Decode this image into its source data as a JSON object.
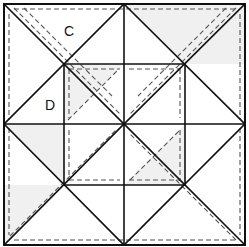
{
  "diagram": {
    "labels": [
      {
        "text": "C",
        "x": 64,
        "y": 36
      },
      {
        "text": "D",
        "x": 45,
        "y": 110
      }
    ],
    "colors": {
      "line": "#111111",
      "seam": "#555555",
      "shade": "#f0f0f0",
      "background": "#ffffff"
    },
    "geometry": {
      "outer": [
        4,
        4,
        245,
        245
      ],
      "center": [
        124,
        124
      ],
      "inner": [
        64,
        64,
        185,
        185
      ]
    },
    "shaded_polygons": [
      "124,4 245,4 185,64",
      "64,64 124,64 64,124",
      "185,124 185,185 124,185",
      "4,245 64,185 4,185",
      "185,64 245,4 245,64",
      "4,124 64,124 64,185"
    ],
    "solid_lines": [
      [
        4,
        4,
        124,
        124
      ],
      [
        245,
        4,
        124,
        124
      ],
      [
        4,
        245,
        124,
        124
      ],
      [
        245,
        245,
        124,
        124
      ],
      [
        124,
        4,
        124,
        245
      ],
      [
        4,
        124,
        245,
        124
      ],
      [
        64,
        64,
        185,
        64
      ],
      [
        185,
        64,
        185,
        185
      ],
      [
        185,
        185,
        64,
        185
      ],
      [
        64,
        185,
        64,
        64
      ],
      [
        124,
        4,
        4,
        124
      ],
      [
        124,
        4,
        245,
        124
      ],
      [
        4,
        124,
        124,
        245
      ],
      [
        245,
        124,
        124,
        245
      ]
    ],
    "seam_lines": [
      [
        14,
        9,
        235,
        9
      ],
      [
        9,
        14,
        9,
        120
      ],
      [
        240,
        14,
        240,
        120
      ],
      [
        14,
        240,
        235,
        240
      ],
      [
        9,
        128,
        9,
        235
      ],
      [
        240,
        128,
        240,
        235
      ],
      [
        14,
        8,
        120,
        114
      ],
      [
        236,
        8,
        130,
        114
      ],
      [
        10,
        236,
        116,
        130
      ],
      [
        236,
        240,
        130,
        134
      ],
      [
        69,
        69,
        120,
        69
      ],
      [
        69,
        69,
        69,
        118
      ],
      [
        180,
        69,
        180,
        118
      ],
      [
        129,
        69,
        180,
        69
      ],
      [
        69,
        180,
        120,
        180
      ],
      [
        69,
        130,
        69,
        180
      ],
      [
        180,
        130,
        180,
        180
      ],
      [
        129,
        180,
        180,
        180
      ],
      [
        68,
        120,
        118,
        70
      ],
      [
        130,
        180,
        180,
        130
      ],
      [
        24,
        8,
        112,
        96
      ],
      [
        226,
        8,
        138,
        96
      ]
    ]
  }
}
